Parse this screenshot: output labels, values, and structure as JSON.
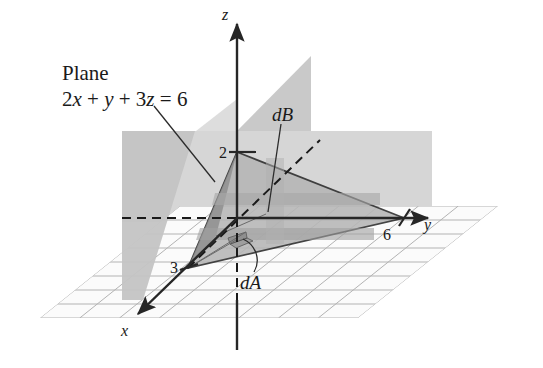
{
  "figure": {
    "kind": "3d-coordinate-diagram",
    "background_color": "#ffffff",
    "ink_color": "#1a1a1a",
    "annotation": {
      "title": "Plane",
      "equation_plain": "2x + y + 3z = 6",
      "equation_parts": {
        "coef_x": "2",
        "var_x": "x",
        "plus_1": "+",
        "var_y": "y",
        "plus_2": "+",
        "coef_z": "3",
        "var_z": "z",
        "equals": "=",
        "rhs": "6"
      }
    },
    "axes": [
      {
        "name": "z-axis",
        "label": "z",
        "direction": "up"
      },
      {
        "name": "y-axis",
        "label": "y",
        "direction": "right"
      },
      {
        "name": "x-axis",
        "label": "x",
        "direction": "down-left"
      }
    ],
    "intercepts": [
      {
        "axis": "z",
        "label": "2",
        "value": 2
      },
      {
        "axis": "x",
        "label": "3",
        "value": 3
      },
      {
        "axis": "y",
        "label": "6",
        "value": 6
      }
    ],
    "element_labels": {
      "dA": "dA",
      "dB": "dB"
    },
    "colors": {
      "plane_fill": "#b9b9b9",
      "backdrop_fill": "#cfcfcf",
      "xz_band_fill": "#bdbdbd",
      "grid_line": "#9a9a9a",
      "axis_line": "#262626",
      "dashed_line": "#1a1a1a",
      "patch_fill": "#9c9c9c"
    }
  }
}
